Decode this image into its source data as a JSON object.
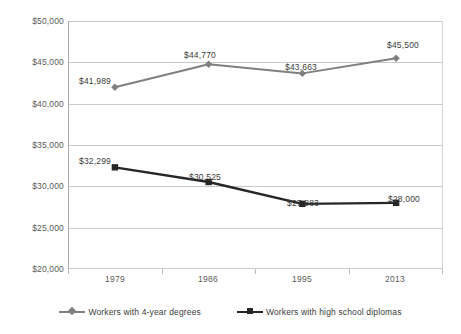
{
  "chart_data": {
    "type": "line",
    "title": "",
    "subtitle": "",
    "xlabel": "",
    "ylabel": "",
    "categories": [
      "1979",
      "1986",
      "1995",
      "2013"
    ],
    "ylim": [
      20000,
      50000
    ],
    "ytick_values": [
      20000,
      25000,
      30000,
      35000,
      40000,
      45000,
      50000
    ],
    "ytick_labels": [
      "$20,000",
      "$25,000",
      "$30,000",
      "$35,000",
      "$40,000",
      "$45,000",
      "$50,000"
    ],
    "grid": true,
    "legend_position": "bottom",
    "series": [
      {
        "name": "Workers with 4-year degrees",
        "color": "#808080",
        "marker": "diamond",
        "values": [
          41989,
          44770,
          43663,
          45500
        ],
        "data_labels": [
          "$41,989",
          "$44,770",
          "$43,663",
          "$45,500"
        ]
      },
      {
        "name": "Workers with high school diplomas",
        "color": "#262626",
        "marker": "square",
        "values": [
          32299,
          30525,
          27883,
          28000
        ],
        "data_labels": [
          "$32,299",
          "$30,525",
          "$27,883",
          "$28,000"
        ]
      }
    ]
  },
  "axis": {
    "y_ticks": [
      {
        "label": "$50,000"
      },
      {
        "label": "$45,000"
      },
      {
        "label": "$40,000"
      },
      {
        "label": "$35,000"
      },
      {
        "label": "$30,000"
      },
      {
        "label": "$25,000"
      },
      {
        "label": "$20,000"
      }
    ],
    "x_ticks": [
      {
        "label": "1979"
      },
      {
        "label": "1986"
      },
      {
        "label": "1995"
      },
      {
        "label": "2013"
      }
    ]
  },
  "legend": {
    "entries": [
      {
        "label": "Workers with 4-year degrees"
      },
      {
        "label": "Workers with high school diplomas"
      }
    ]
  },
  "labels": {
    "s0": [
      "$41,989",
      "$44,770",
      "$43,663",
      "$45,500"
    ],
    "s1": [
      "$32,299",
      "$30,525",
      "$27,883",
      "$28,000"
    ]
  },
  "colors": {
    "series_degrees": "#808080",
    "series_diploma": "#262626",
    "grid": "#c9c9c9",
    "axis": "#a8a8a8",
    "text": "#5a5a5a",
    "background": "#ffffff"
  }
}
